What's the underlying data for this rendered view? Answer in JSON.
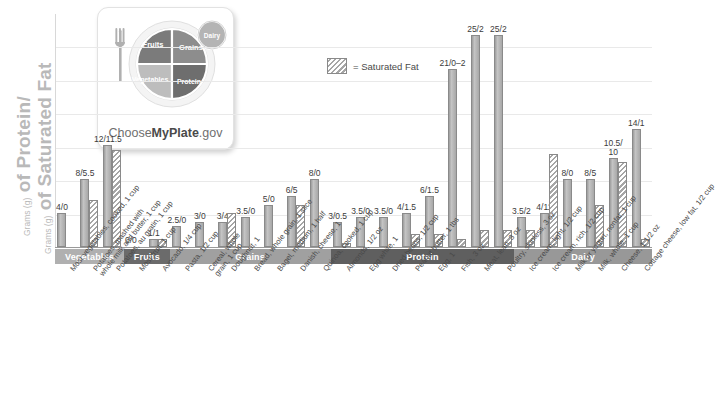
{
  "axis": {
    "title_line1_small": "Grams (g)",
    "title_line1_big": "of Protein/",
    "title_line2_small": "Grams (g)",
    "title_line2_big": "of Saturated Fat"
  },
  "legend": {
    "swatch_name": "saturated-fat-swatch",
    "label": "= Saturated Fat"
  },
  "logo": {
    "brand_prefix": "Choose",
    "brand_bold": "MyPlate",
    "brand_suffix": ".gov",
    "segments": {
      "fruits": "Fruits",
      "grains": "Grains",
      "vegetables": "Vegetables",
      "protein": "Protein",
      "dairy": "Dairy"
    },
    "colors": {
      "fruits": "#7b7b7b",
      "grains": "#8d8d8d",
      "vegetables": "#bdbdbd",
      "protein": "#6e6e6e",
      "dairy": "#b4b4b4"
    }
  },
  "bands": [
    {
      "label": "Vegetables",
      "count": 3,
      "color": "#b0b0b0"
    },
    {
      "label": "Fruits",
      "count": 2,
      "color": "#6b6b6b"
    },
    {
      "label": "Grains",
      "count": 7,
      "color": "#a0a0a0"
    },
    {
      "label": "Protein",
      "count": 8,
      "color": "#5f5f5f"
    },
    {
      "label": "Dairy",
      "count": 6,
      "color": "#989898"
    }
  ],
  "chart_data": {
    "type": "bar",
    "title": "",
    "xlabel": "",
    "ylabel": "Grams (g) of Protein/Grams (g) of Saturated Fat",
    "ylim": [
      0,
      26
    ],
    "grid": true,
    "legend_position": "top-center",
    "label_format": "protein/saturated_fat",
    "categories": [
      "Most vegetables, cooked, 1 cup",
      "Potatoes, mashed with whole milk and butter, 1 cup",
      "Potatoes, au gratin, 1 cup",
      "Most fruit, 1 cup",
      "Avocado, 1/4 cup",
      "Pasta, 1/2 cup",
      "Cereal, whole grain, 1 cup",
      "Doughnut, 1",
      "Bread, whole grain, 1 slice",
      "Bagel, medium, 1 half",
      "Danish, cheese, 1",
      "Quinoa, cooked, 1 cup",
      "Almonds, 1/2 oz",
      "Egg white, 1",
      "Dried beans, 1/2 cup",
      "Peanut butter, 1 tbs",
      "Egg, 1",
      "Fish, 3 oz",
      "Meat, lean, 3 oz",
      "Poultry, skinless, 3 oz",
      "Ice cream, light, 1/2 cup",
      "Ice cream, rich, 1/2 cup",
      "Milk or yogurt, nonfat, 1/2 cup",
      "Milk, whole, 1 cup",
      "Cheese, 1 1/2 oz",
      "Cottage cheese, low fat, 1/2 cup"
    ],
    "category_lines": [
      [
        "Most vegetables, cooked, 1 cup"
      ],
      [
        "Potatoes, mashed with",
        "whole milk and butter, 1 cup"
      ],
      [
        "Potatoes, au gratin, 1 cup"
      ],
      [
        "Most fruit, 1 cup"
      ],
      [
        "Avocado, 1/4 cup"
      ],
      [
        "Pasta, 1/2 cup"
      ],
      [
        "Cereal, whole",
        "grain, 1 cup"
      ],
      [
        "Doughnut, 1"
      ],
      [
        "Bread, whole grain, 1 slice"
      ],
      [
        "Bagel, medium, 1 half"
      ],
      [
        "Danish, cheese, 1"
      ],
      [
        "Quinoa, cooked, 1 cup"
      ],
      [
        "Almonds, 1/2 oz"
      ],
      [
        "Egg white, 1"
      ],
      [
        "Dried beans, 1/2 cup"
      ],
      [
        "Peanut butter, 1 tbs"
      ],
      [
        "Egg, 1"
      ],
      [
        "Fish, 3 oz"
      ],
      [
        "Meat, lean, 3 oz"
      ],
      [
        "Poultry, skinless, 3 oz"
      ],
      [
        "Ice cream, light, 1/2 cup"
      ],
      [
        "Ice cream, rich, 1/2 cup"
      ],
      [
        "Milk or yogurt, nonfat, 1 cup"
      ],
      [
        "Milk, whole, 1 cup"
      ],
      [
        "Cheese, 1 1/2 oz"
      ],
      [
        "Cottage cheese, low fat, 1/2 cup"
      ]
    ],
    "series": [
      {
        "name": "Protein",
        "values": [
          4,
          8,
          12,
          0,
          1,
          2.5,
          3,
          3,
          3.5,
          5,
          6,
          8,
          3,
          3.5,
          3.5,
          4,
          6,
          21,
          25,
          25,
          3.5,
          4,
          8,
          8,
          10.5,
          14
        ]
      },
      {
        "name": "Saturated Fat",
        "values": [
          0,
          5.5,
          11.5,
          0,
          1,
          0,
          0,
          4,
          0,
          0,
          5,
          0,
          0.5,
          0,
          0,
          1.5,
          1.5,
          1,
          2,
          2,
          2,
          11,
          0,
          5,
          10,
          1
        ]
      }
    ],
    "data_labels": [
      "4/0",
      "8/5.5",
      "12/11.5",
      "0/0",
      "1/1",
      "2.5/0",
      "3/0",
      "3/4",
      "3.5/0",
      "5/0",
      "6/5",
      "8/0",
      "3/0.5",
      "3.5/0",
      "3.5/0",
      "4/1.5",
      "6/1.5",
      "21/0–2",
      "25/2",
      "25/2",
      "3.5/2",
      "4/11",
      "8/0",
      "8/5",
      "10.5/\n10",
      "14/1"
    ]
  }
}
